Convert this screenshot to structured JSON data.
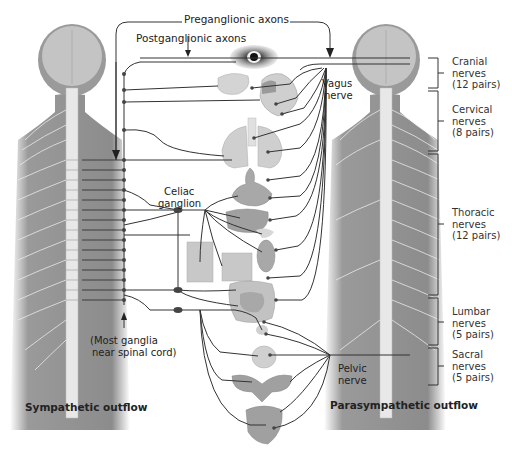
{
  "diagram": {
    "top_labels": {
      "preganglionic": "Preganglionic axons",
      "postganglionic": "Postganglionic axons"
    },
    "ganglion_labels": {
      "celiac_line1": "Celiac",
      "celiac_line2": "ganglion",
      "most_ganglia_line1": "(Most ganglia",
      "most_ganglia_line2": "near spinal cord)"
    },
    "nerve_labels": {
      "vagus_line1": "Vagus",
      "vagus_line2": "nerve",
      "pelvic_line1": "Pelvic",
      "pelvic_line2": "nerve"
    },
    "spinal_regions": [
      {
        "name": "Cranial",
        "line2": "nerves",
        "line3": "(12 pairs)"
      },
      {
        "name": "Cervical",
        "line2": "nerves",
        "line3": "(8 pairs)"
      },
      {
        "name": "Thoracic",
        "line2": "nerves",
        "line3": "(12 pairs)"
      },
      {
        "name": "Lumbar",
        "line2": "nerves",
        "line3": "(5 pairs)"
      },
      {
        "name": "Sacral",
        "line2": "nerves",
        "line3": "(5 pairs)"
      }
    ],
    "captions": {
      "left": "Sympathetic outflow",
      "right": "Parasympathetic outflow"
    },
    "organs": [
      "eye",
      "salivary-glands",
      "heart",
      "lungs",
      "stomach",
      "liver",
      "pancreas",
      "adrenal-gland",
      "kidney",
      "intestines",
      "bladder",
      "reproductive-organs",
      "rectum"
    ],
    "colors": {
      "body": "#8a8a8a",
      "head": "#b8b8b8",
      "spine": "#e6e6e6",
      "organ": "#9a9a9a",
      "organ_light": "#cfcfcf",
      "line": "#333333"
    }
  }
}
